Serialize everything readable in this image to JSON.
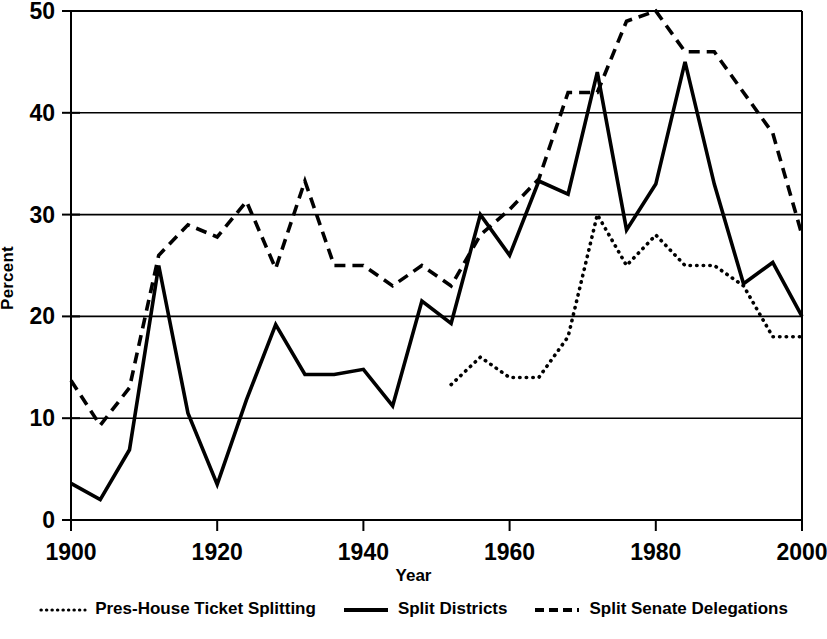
{
  "chart_data": {
    "type": "line",
    "title": "",
    "xlabel": "Year",
    "ylabel": "Percent",
    "xlim": [
      1900,
      2000
    ],
    "ylim": [
      0,
      50
    ],
    "xticks": [
      1900,
      1920,
      1940,
      1960,
      1980,
      2000
    ],
    "yticks": [
      0,
      10,
      20,
      30,
      40,
      50
    ],
    "grid": "horizontal",
    "legend_position": "below",
    "line_color": "#000000",
    "series": [
      {
        "name": "Pres-House Ticket Splitting",
        "style": "dotted",
        "x": [
          1952,
          1956,
          1960,
          1964,
          1968,
          1972,
          1976,
          1980,
          1984,
          1988,
          1992,
          1996,
          2000
        ],
        "values": [
          13.3,
          16.0,
          14.0,
          14.0,
          18.0,
          30.0,
          25.0,
          28.0,
          25.0,
          25.0,
          23.0,
          18.0,
          18.0
        ]
      },
      {
        "name": "Split Districts",
        "style": "solid",
        "x": [
          1900,
          1904,
          1908,
          1912,
          1916,
          1920,
          1924,
          1928,
          1932,
          1936,
          1940,
          1944,
          1948,
          1952,
          1956,
          1960,
          1964,
          1968,
          1972,
          1976,
          1980,
          1984,
          1988,
          1992,
          1996,
          2000
        ],
        "values": [
          3.6,
          2.0,
          6.9,
          25.0,
          10.5,
          3.5,
          11.8,
          19.2,
          14.3,
          14.3,
          14.8,
          11.2,
          21.5,
          19.3,
          30.0,
          26.0,
          33.3,
          32.0,
          44.0,
          28.5,
          33.0,
          45.0,
          33.0,
          23.2,
          25.3,
          20.0
        ]
      },
      {
        "name": "Split Senate Delegations",
        "style": "dashed",
        "x": [
          1900,
          1904,
          1908,
          1912,
          1916,
          1920,
          1924,
          1928,
          1932,
          1936,
          1940,
          1944,
          1948,
          1952,
          1956,
          1960,
          1964,
          1968,
          1972,
          1976,
          1980,
          1984,
          1988,
          1992,
          1996,
          2000
        ],
        "values": [
          13.7,
          9.3,
          13.0,
          26.0,
          29.0,
          27.8,
          31.3,
          24.7,
          33.3,
          25.0,
          25.0,
          23.0,
          25.0,
          23.0,
          28.0,
          30.5,
          33.5,
          42.0,
          42.0,
          49.0,
          50.0,
          46.0,
          46.0,
          42.0,
          38.0,
          28.0
        ]
      }
    ]
  },
  "axis": {
    "ylabel": "Percent",
    "xlabel": "Year"
  },
  "legend": {
    "items": [
      {
        "label": "Pres-House Ticket Splitting",
        "style": "dotted"
      },
      {
        "label": "Split Districts",
        "style": "solid"
      },
      {
        "label": "Split Senate Delegations",
        "style": "dashed"
      }
    ]
  }
}
